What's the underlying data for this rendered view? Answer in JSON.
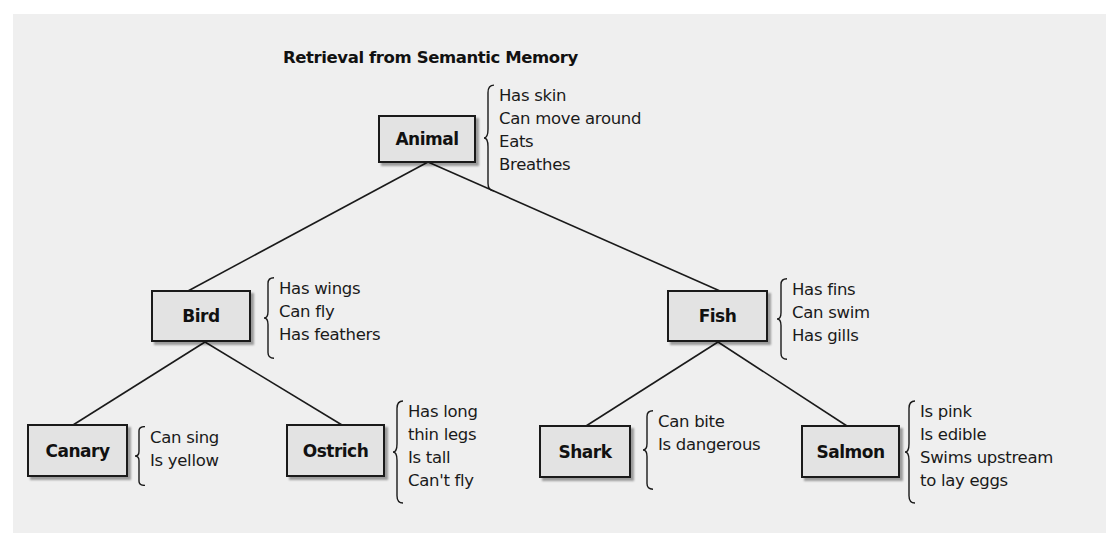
{
  "figure": {
    "title": "Retrieval from Semantic Memory",
    "colors": {
      "panel_bg": "#efefef",
      "node_fill": "#e3e3e3",
      "line": "#1a1a1a"
    }
  },
  "nodes": {
    "animal": {
      "label": "Animal",
      "properties": [
        "Has skin",
        "Can move around",
        "Eats",
        "Breathes"
      ]
    },
    "bird": {
      "label": "Bird",
      "properties": [
        "Has wings",
        "Can fly",
        "Has feathers"
      ]
    },
    "fish": {
      "label": "Fish",
      "properties": [
        "Has fins",
        "Can swim",
        "Has gills"
      ]
    },
    "canary": {
      "label": "Canary",
      "properties": [
        "Can sing",
        "Is yellow"
      ]
    },
    "ostrich": {
      "label": "Ostrich",
      "properties": [
        "Has long",
        "thin legs",
        "Is tall",
        "Can't fly"
      ]
    },
    "shark": {
      "label": "Shark",
      "properties": [
        "Can bite",
        "Is dangerous"
      ]
    },
    "salmon": {
      "label": "Salmon",
      "properties": [
        "Is pink",
        "Is edible",
        "Swims upstream",
        "to lay eggs"
      ]
    }
  },
  "edges": [
    {
      "from": "Animal",
      "to": "Bird"
    },
    {
      "from": "Animal",
      "to": "Fish"
    },
    {
      "from": "Bird",
      "to": "Canary"
    },
    {
      "from": "Bird",
      "to": "Ostrich"
    },
    {
      "from": "Fish",
      "to": "Shark"
    },
    {
      "from": "Fish",
      "to": "Salmon"
    }
  ]
}
